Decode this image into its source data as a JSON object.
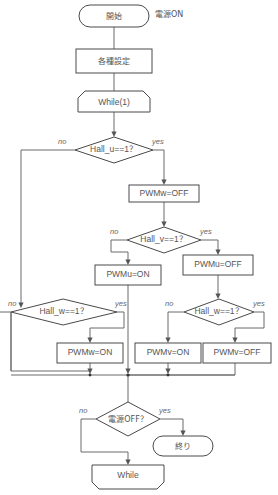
{
  "diagram": {
    "title_note": "電源ON",
    "nodes": {
      "start": {
        "label": "開始",
        "type": "terminator"
      },
      "settings": {
        "label": "各種設定",
        "type": "process"
      },
      "while_begin": {
        "label": "While(1)",
        "type": "loop-start"
      },
      "dec_hall_u": {
        "label": "Hall_u==1？",
        "type": "decision"
      },
      "pwmw_off": {
        "label": "PWMw=OFF",
        "type": "process"
      },
      "dec_hall_v": {
        "label": "Hall_v==1？",
        "type": "decision"
      },
      "pwmu_on": {
        "label": "PWMu=ON",
        "type": "process"
      },
      "pwmu_off": {
        "label": "PWMu=OFF",
        "type": "process"
      },
      "dec_hall_w_left": {
        "label": "Hall_w==1？",
        "type": "decision"
      },
      "dec_hall_w_right": {
        "label": "Hall_w==1？",
        "type": "decision"
      },
      "pwmw_on": {
        "label": "PWMw=ON",
        "type": "process"
      },
      "pwmv_on": {
        "label": "PWMv=ON",
        "type": "process"
      },
      "pwmv_off": {
        "label": "PWMv=OFF",
        "type": "process"
      },
      "dec_power_off": {
        "label": "電源OFF？",
        "type": "decision"
      },
      "end": {
        "label": "終り",
        "type": "terminator"
      },
      "while_end": {
        "label": "While",
        "type": "loop-end"
      }
    },
    "branch_labels": {
      "hall_u_no": "no",
      "hall_u_yes": "yes",
      "hall_v_no": "no",
      "hall_v_yes": "yes",
      "hall_w_left_no": "no",
      "hall_w_left_yes": "yes",
      "hall_w_right_no": "no",
      "hall_w_right_yes": "yes",
      "power_off_no": "no",
      "power_off_yes": "yes"
    },
    "colors": {
      "shape_stroke": "#4a4a4a",
      "connector": "#6a6a6a",
      "text": "#555555",
      "background": "#ffffff"
    }
  }
}
